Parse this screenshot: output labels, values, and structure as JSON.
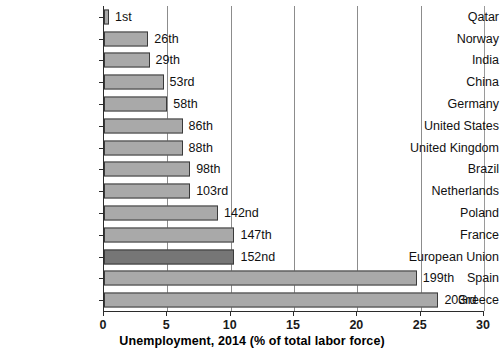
{
  "chart_data": {
    "type": "bar",
    "orientation": "horizontal",
    "title": "",
    "xlabel": "Unemployment, 2014 (% of total labor force)",
    "ylabel": "",
    "xlim": [
      0,
      30
    ],
    "xticks": [
      0,
      5,
      10,
      15,
      20,
      25,
      30
    ],
    "xtick_labels": [
      "0",
      "5",
      "10",
      "15",
      "20",
      "25",
      "30"
    ],
    "grid": true,
    "grid_axis": "x",
    "legend": false,
    "bar_color": "#a9a9a9",
    "highlight_color": "#767676",
    "categories": [
      "Qatar",
      "Norway",
      "India",
      "China",
      "Germany",
      "United States",
      "United Kingdom",
      "Brazil",
      "Netherlands",
      "Poland",
      "France",
      "European Union",
      "Spain",
      "Greece"
    ],
    "values": [
      0.4,
      3.5,
      3.6,
      4.7,
      5.0,
      6.2,
      6.2,
      6.8,
      6.8,
      9.0,
      10.3,
      10.3,
      24.7,
      26.4
    ],
    "annotations": [
      "1st",
      "26th",
      "29th",
      "53rd",
      "58th",
      "86th",
      "88th",
      "98th",
      "103rd",
      "142nd",
      "147th",
      "152nd",
      "199th",
      "203rd"
    ],
    "highlighted": [
      "European Union"
    ]
  }
}
